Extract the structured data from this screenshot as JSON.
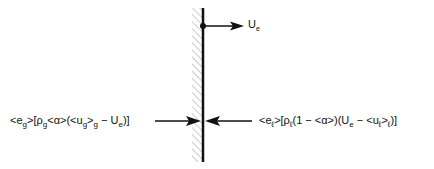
{
  "diagram": {
    "title": "",
    "wall": {
      "x": 203,
      "y_top": 8,
      "y_bottom": 162,
      "hatch_side": "left"
    },
    "velocity_arrow": {
      "label_main": "U",
      "label_sub": "e",
      "direction": "right"
    },
    "left_flux": {
      "segments": [
        {
          "t": "<e"
        },
        {
          "sub": "g"
        },
        {
          "t": ">[ρ"
        },
        {
          "sub": "g"
        },
        {
          "t": "<α>(<u"
        },
        {
          "sub": "g"
        },
        {
          "t": ">"
        },
        {
          "sub": "g"
        },
        {
          "t": " − U"
        },
        {
          "sub": "e"
        },
        {
          "t": ")]"
        }
      ],
      "text": "<e_g>[ρ_g<α>(<u_g>_g − U_e)]",
      "direction": "right"
    },
    "right_flux": {
      "segments": [
        {
          "t": "<e"
        },
        {
          "sub": "ℓ"
        },
        {
          "t": ">[ρ"
        },
        {
          "sub": "ℓ"
        },
        {
          "t": "(1 − <α>)(U"
        },
        {
          "sub": "e"
        },
        {
          "t": " − <u"
        },
        {
          "sub": "ℓ"
        },
        {
          "t": ">"
        },
        {
          "sub": "ℓ"
        },
        {
          "t": ")]"
        }
      ],
      "text": "<e_ℓ>[ρ_ℓ(1 − <α>)(U_e − <u_ℓ>_ℓ)]",
      "direction": "left"
    },
    "colors": {
      "line": "#111111",
      "hatch": "#999999",
      "background": "#ffffff"
    }
  }
}
